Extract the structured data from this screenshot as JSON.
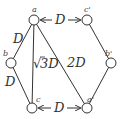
{
  "diagram": {
    "nodes": [
      {
        "id": "a",
        "label": "a",
        "x": 34,
        "y": 20
      },
      {
        "id": "b",
        "label": "b",
        "x": 11,
        "y": 63
      },
      {
        "id": "c",
        "label": "c",
        "x": 32,
        "y": 108
      },
      {
        "id": "c2",
        "label": "c'",
        "x": 87,
        "y": 20
      },
      {
        "id": "b2",
        "label": "b'",
        "x": 111,
        "y": 63
      },
      {
        "id": "a2",
        "label": "a'",
        "x": 87,
        "y": 108
      }
    ],
    "edges": [
      {
        "from": "a",
        "to": "b",
        "label": "D"
      },
      {
        "from": "b",
        "to": "c",
        "label": "D"
      },
      {
        "from": "a",
        "to": "c",
        "label": "√3D"
      },
      {
        "from": "a",
        "to": "a2",
        "label": "2D"
      },
      {
        "from": "c2",
        "to": "b2",
        "label": ""
      },
      {
        "from": "b2",
        "to": "a2",
        "label": ""
      }
    ],
    "arrows": [
      {
        "from": "a",
        "to": "c2",
        "label": "D"
      },
      {
        "from": "c",
        "to": "a2",
        "label": "D"
      }
    ],
    "labels": {
      "top_arrow": "D",
      "bottom_arrow": "D",
      "ab": "D",
      "bc": "D",
      "ac_sqrt": "√",
      "ac_rest": "3D",
      "aa2": "2D",
      "a": "a",
      "b": "b",
      "c": "c",
      "c2": "c'",
      "b2": "b'",
      "a2": "a'"
    },
    "colors": {
      "stroke": "#333333",
      "background": "#ffffff"
    }
  }
}
